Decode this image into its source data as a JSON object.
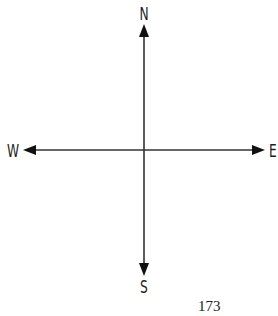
{
  "diagram": {
    "type": "compass-rose",
    "directions": {
      "north": "N",
      "south": "S",
      "east": "E",
      "west": "W"
    },
    "line_color": "#222222"
  },
  "page_number": "173"
}
